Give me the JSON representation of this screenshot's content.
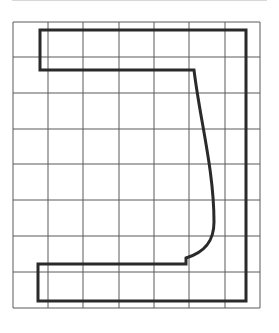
{
  "diagram": {
    "type": "grid-outline-shape",
    "grid": {
      "columns": 7,
      "rows": 8,
      "x_lines": [
        13,
        48,
        83,
        119,
        154,
        189,
        225,
        260
      ],
      "y_lines": [
        22,
        57,
        93,
        129,
        164,
        200,
        236,
        272,
        308
      ],
      "line_color": "#555555"
    },
    "shape": {
      "description": "Closed bracket-like outline with curved inner right edge",
      "stroke_color": "#2a2a2a",
      "stroke_width": 3
    }
  }
}
